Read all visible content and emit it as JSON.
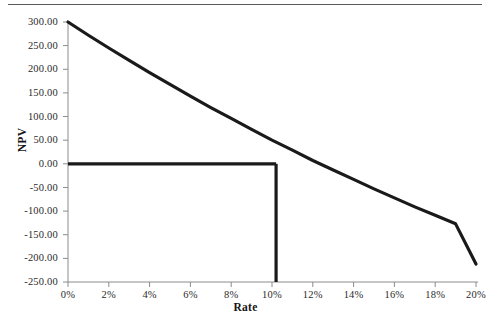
{
  "figure": {
    "name": "npv-profile-chart",
    "has_top_rule": true,
    "background_color": "#ffffff",
    "line_color": "#1a1a1a",
    "axis_color": "#808080"
  },
  "chart_data": {
    "type": "line",
    "title": "",
    "xlabel": "Rate",
    "ylabel": "NPV",
    "xlim": [
      0,
      20
    ],
    "ylim": [
      -250,
      300
    ],
    "grid": false,
    "legend": "none",
    "x_tick_labels": [
      "0%",
      "2%",
      "4%",
      "6%",
      "8%",
      "10%",
      "12%",
      "14%",
      "16%",
      "18%",
      "20%"
    ],
    "x_tick_values": [
      0,
      2,
      4,
      6,
      8,
      10,
      12,
      14,
      16,
      18,
      20
    ],
    "y_tick_labels": [
      "300.00",
      "250.00",
      "200.00",
      "150.00",
      "100.00",
      "50.00",
      "0.00",
      "-50.00",
      "-100.00",
      "-150.00",
      "-200.00",
      "-250.00"
    ],
    "y_tick_values": [
      300,
      250,
      200,
      150,
      100,
      50,
      0,
      -50,
      -100,
      -150,
      -200,
      -250
    ],
    "series": [
      {
        "name": "NPV",
        "x": [
          0,
          1,
          2,
          3,
          4,
          5,
          6,
          7,
          8,
          9,
          10,
          11,
          12,
          13,
          14,
          15,
          16,
          17,
          18,
          19,
          20
        ],
        "values": [
          300,
          272,
          245,
          219,
          193,
          168,
          143,
          119,
          96,
          73,
          50,
          29,
          7,
          -13,
          -33,
          -53,
          -72,
          -91,
          -109,
          -127,
          -212
        ]
      }
    ],
    "annotations": [
      {
        "name": "zero-reference-line",
        "type": "horizontal-line",
        "y": 0,
        "x_start": 0,
        "x_end": 10.2
      },
      {
        "name": "irr-indicator-line",
        "type": "vertical-line",
        "x": 10.2,
        "y_start": -250,
        "y_end": 0
      }
    ],
    "irr_value": 10.2
  }
}
